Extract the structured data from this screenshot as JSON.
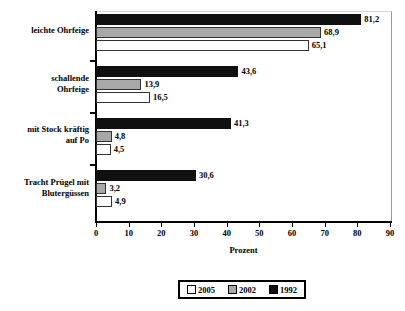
{
  "chart_data": {
    "type": "bar",
    "orientation": "horizontal",
    "title": "",
    "xlabel": "Prozent",
    "ylabel": "",
    "xlim": [
      0,
      90
    ],
    "xticks": [
      0,
      10,
      20,
      30,
      40,
      50,
      60,
      70,
      80,
      90
    ],
    "grid": false,
    "legend_position": "bottom",
    "categories": [
      "leichte Ohrfeige",
      "schallende Ohrfeige",
      "mit Stock kräftig auf Po",
      "Tracht Prügel mit Blutergüssen"
    ],
    "series": [
      {
        "name": "2005",
        "color": "#ffffff",
        "values": [
          65.1,
          16.5,
          4.5,
          4.9
        ]
      },
      {
        "name": "2002",
        "color": "#a8a8a8",
        "values": [
          68.9,
          13.9,
          4.8,
          3.2
        ]
      },
      {
        "name": "1992",
        "color": "#101010",
        "values": [
          81.2,
          43.6,
          41.3,
          30.6
        ]
      }
    ],
    "value_labels": {
      "2005": [
        "65,1",
        "16,5",
        "4,5",
        "4,9"
      ],
      "2002": [
        "68,9",
        "13,9",
        "4,8",
        "3,2"
      ],
      "1992": [
        "81,2",
        "43,6",
        "41,3",
        "30,6"
      ]
    }
  },
  "category_label_lines": [
    [
      "leichte Ohrfeige"
    ],
    [
      "schallende",
      "Ohrfeige"
    ],
    [
      "mit Stock kräftig",
      "auf Po"
    ],
    [
      "Tracht Prügel mit",
      "Blutergüssen"
    ]
  ],
  "axis": {
    "x_title": "Prozent",
    "x_tick_labels": [
      "0",
      "10",
      "20",
      "30",
      "40",
      "50",
      "60",
      "70",
      "80",
      "90"
    ]
  },
  "legend": {
    "entries": [
      {
        "label": "2005",
        "swatch": "s2005"
      },
      {
        "label": "2002",
        "swatch": "s2002"
      },
      {
        "label": "1992",
        "swatch": "s1992"
      }
    ]
  }
}
